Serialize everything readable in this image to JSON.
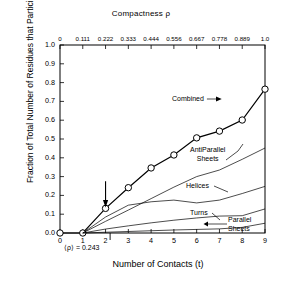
{
  "chart_data": {
    "type": "line",
    "title": "",
    "top_axis": {
      "label": "Compactness ρ",
      "ticks": [
        "0",
        "0.111",
        "0.222",
        "0.333",
        "0.444",
        "0.556",
        "0.667",
        "0.778",
        "0.889",
        "1.0"
      ],
      "range": [
        0,
        1.0
      ]
    },
    "xlabel": "Number of Contacts (t)",
    "xticks": [
      "0",
      "1",
      "2",
      "3",
      "4",
      "5",
      "6",
      "7",
      "8",
      "9"
    ],
    "xlim": [
      0,
      9
    ],
    "ylabel": "Fraction of Total Number of Residues that Participate",
    "yticks": [
      "0.0",
      "0.1",
      "0.2",
      "0.3",
      "0.4",
      "0.5",
      "0.6",
      "0.7",
      "0.8",
      "0.9",
      "1.0"
    ],
    "ylim": [
      0,
      1.0
    ],
    "grid": false,
    "legend": "inline-labels",
    "annotations": [
      {
        "name": "mean-compactness",
        "text": "⟨ρ⟩ = 0.243",
        "x": 2.2,
        "y": 0
      },
      {
        "name": "arrow-marker",
        "text": "",
        "x": 2.0,
        "y": 0.2
      }
    ],
    "series": [
      {
        "name": "Combined",
        "label": "Combined",
        "marker": "open-circle",
        "x": [
          0,
          1,
          2,
          3,
          4,
          5,
          6,
          7,
          8,
          9
        ],
        "values": [
          0.0,
          0.0,
          0.131,
          0.241,
          0.346,
          0.415,
          0.506,
          0.542,
          0.601,
          0.765
        ]
      },
      {
        "name": "AntiParallel Sheets",
        "label": "AntiParallel Sheets",
        "marker": "none",
        "x": [
          1,
          2,
          3,
          4,
          5,
          6,
          7,
          8,
          9
        ],
        "values": [
          0.0,
          0.062,
          0.122,
          0.183,
          0.244,
          0.3,
          0.335,
          0.392,
          0.452
        ]
      },
      {
        "name": "Helices",
        "label": "Helices",
        "marker": "none",
        "x": [
          1,
          2,
          3,
          4,
          5,
          6,
          7,
          8,
          9
        ],
        "values": [
          0.0,
          0.085,
          0.148,
          0.166,
          0.175,
          0.16,
          0.175,
          0.21,
          0.248
        ]
      },
      {
        "name": "Turns",
        "label": "Turns",
        "marker": "none",
        "x": [
          1,
          2,
          3,
          4,
          5,
          6,
          7,
          8,
          9
        ],
        "values": [
          0.0,
          0.021,
          0.038,
          0.054,
          0.068,
          0.08,
          0.09,
          0.092,
          0.128
        ]
      },
      {
        "name": "Parallel Sheets",
        "label": "Parallel Sheets",
        "marker": "none",
        "x": [
          1,
          2,
          3,
          4,
          5,
          6,
          7,
          8,
          9
        ],
        "values": [
          0.0,
          0.004,
          0.008,
          0.012,
          0.016,
          0.019,
          0.022,
          0.03,
          0.052
        ]
      }
    ],
    "curve_labels": [
      {
        "name": "combined",
        "line1": "Combined",
        "line2": ""
      },
      {
        "name": "antiparallel-sheets",
        "line1": "AntiParallel",
        "line2": "Sheets"
      },
      {
        "name": "helices",
        "line1": "Helices",
        "line2": ""
      },
      {
        "name": "turns",
        "line1": "Turns",
        "line2": ""
      },
      {
        "name": "parallel-sheets",
        "line1": "Parallel",
        "line2": "Sheets"
      }
    ],
    "colors": {
      "ink": "#000000",
      "background": "#ffffff"
    }
  }
}
